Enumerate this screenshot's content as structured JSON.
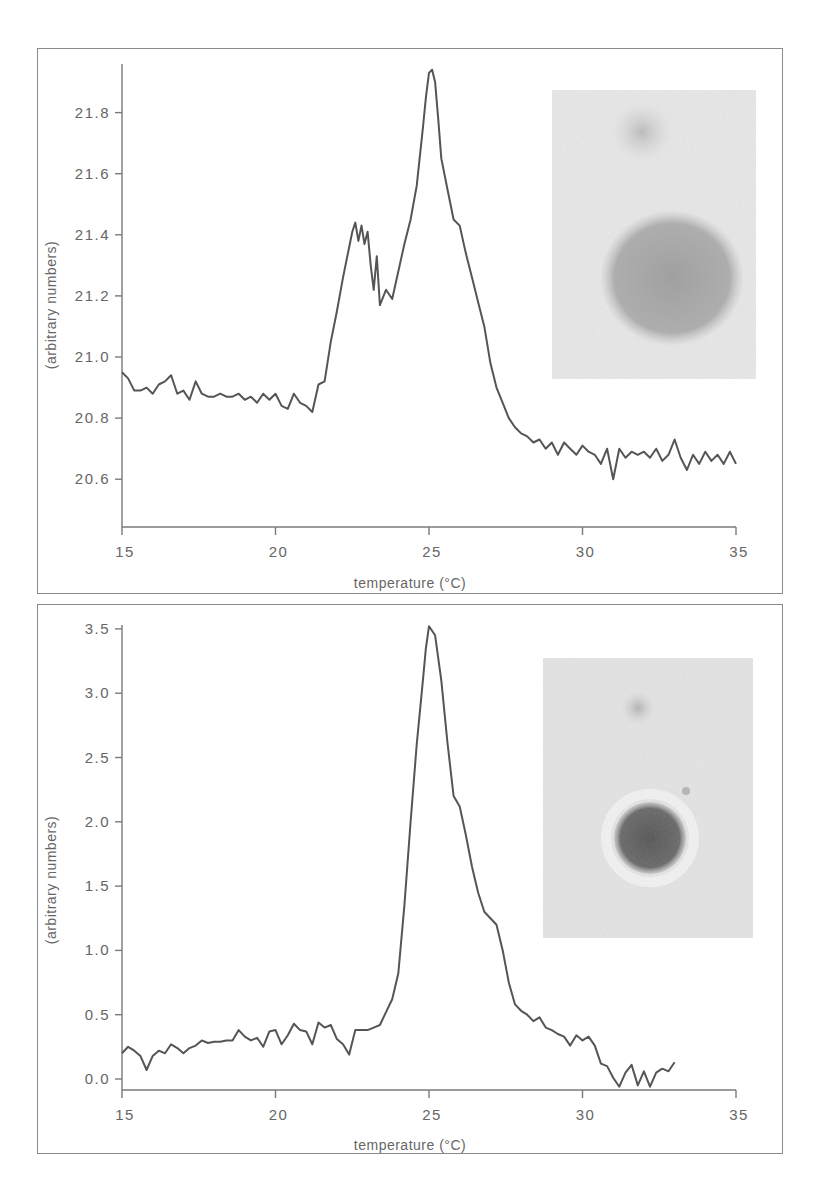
{
  "chart_data": [
    {
      "type": "line",
      "title": "",
      "xlabel": "temperature (°C)",
      "ylabel": "(arbitrary numbers)",
      "xlim": [
        15,
        35
      ],
      "ylim": [
        20.45,
        21.95
      ],
      "xticks": [
        15,
        20,
        25,
        30,
        35
      ],
      "xtick_labels": [
        "15",
        "20",
        "25",
        "30",
        "35"
      ],
      "yticks": [
        20.6,
        20.8,
        21.0,
        21.2,
        21.4,
        21.6,
        21.8
      ],
      "ytick_labels": [
        "20.6",
        "20.8",
        "21.0",
        "21.2",
        "21.4",
        "21.6",
        "21.8"
      ],
      "grid": false,
      "legend": null,
      "inset": "micrograph: faint small spot above a large diffuse grey circular domain",
      "series": [
        {
          "name": "signal",
          "x": [
            15.0,
            15.2,
            15.4,
            15.6,
            15.8,
            16.0,
            16.2,
            16.4,
            16.6,
            16.8,
            17.0,
            17.2,
            17.4,
            17.6,
            17.8,
            18.0,
            18.2,
            18.4,
            18.6,
            18.8,
            19.0,
            19.2,
            19.4,
            19.6,
            19.8,
            20.0,
            20.2,
            20.4,
            20.6,
            20.8,
            21.0,
            21.2,
            21.4,
            21.6,
            21.8,
            22.0,
            22.2,
            22.4,
            22.5,
            22.6,
            22.7,
            22.8,
            22.9,
            23.0,
            23.1,
            23.2,
            23.3,
            23.4,
            23.6,
            23.8,
            24.0,
            24.2,
            24.4,
            24.6,
            24.8,
            24.9,
            25.0,
            25.1,
            25.2,
            25.3,
            25.4,
            25.6,
            25.8,
            26.0,
            26.2,
            26.4,
            26.6,
            26.8,
            27.0,
            27.2,
            27.4,
            27.6,
            27.8,
            28.0,
            28.2,
            28.4,
            28.6,
            28.8,
            29.0,
            29.2,
            29.4,
            29.6,
            29.8,
            30.0,
            30.2,
            30.4,
            30.6,
            30.8,
            31.0,
            31.2,
            31.4,
            31.6,
            31.8,
            32.0,
            32.2,
            32.4,
            32.6,
            32.8,
            33.0,
            33.2,
            33.4,
            33.6,
            33.8,
            34.0,
            34.2,
            34.4,
            34.6,
            34.8,
            35.0
          ],
          "y": [
            20.95,
            20.93,
            20.89,
            20.89,
            20.9,
            20.88,
            20.91,
            20.92,
            20.94,
            20.88,
            20.89,
            20.86,
            20.92,
            20.88,
            20.87,
            20.87,
            20.88,
            20.87,
            20.87,
            20.88,
            20.86,
            20.87,
            20.85,
            20.88,
            20.86,
            20.88,
            20.84,
            20.83,
            20.88,
            20.85,
            20.84,
            20.82,
            20.91,
            20.92,
            21.05,
            21.15,
            21.26,
            21.36,
            21.41,
            21.44,
            21.38,
            21.43,
            21.37,
            21.41,
            21.3,
            21.22,
            21.33,
            21.17,
            21.22,
            21.19,
            21.28,
            21.37,
            21.45,
            21.56,
            21.75,
            21.85,
            21.93,
            21.94,
            21.9,
            21.78,
            21.65,
            21.55,
            21.45,
            21.43,
            21.34,
            21.26,
            21.18,
            21.1,
            20.98,
            20.9,
            20.85,
            20.8,
            20.77,
            20.75,
            20.74,
            20.72,
            20.73,
            20.7,
            20.72,
            20.68,
            20.72,
            20.7,
            20.68,
            20.71,
            20.69,
            20.68,
            20.65,
            20.7,
            20.6,
            20.7,
            20.67,
            20.69,
            20.68,
            20.69,
            20.67,
            20.7,
            20.66,
            20.68,
            20.73,
            20.67,
            20.63,
            20.68,
            20.65,
            20.69,
            20.66,
            20.68,
            20.65,
            20.69,
            20.65
          ]
        }
      ]
    },
    {
      "type": "line",
      "title": "",
      "xlabel": "temperature (°C)",
      "ylabel": "(arbitrary numbers)",
      "xlim": [
        15,
        35
      ],
      "ylim": [
        -0.08,
        3.6
      ],
      "xticks": [
        15,
        20,
        25,
        30,
        35
      ],
      "xtick_labels": [
        "15",
        "20",
        "25",
        "30",
        "35"
      ],
      "yticks": [
        0.0,
        0.5,
        1.0,
        1.5,
        2.0,
        2.5,
        3.0,
        3.5
      ],
      "ytick_labels": [
        "0.0",
        "0.5",
        "1.0",
        "1.5",
        "2.0",
        "2.5",
        "3.0",
        "3.5"
      ],
      "grid": false,
      "legend": null,
      "inset": "micrograph: faint small spot above a dark compact circular domain with a light halo",
      "series": [
        {
          "name": "signal",
          "x": [
            15.0,
            15.2,
            15.4,
            15.6,
            15.8,
            16.0,
            16.2,
            16.4,
            16.6,
            16.8,
            17.0,
            17.2,
            17.4,
            17.6,
            17.8,
            18.0,
            18.2,
            18.4,
            18.6,
            18.8,
            19.0,
            19.2,
            19.4,
            19.6,
            19.8,
            20.0,
            20.2,
            20.4,
            20.6,
            20.8,
            21.0,
            21.2,
            21.4,
            21.6,
            21.8,
            22.0,
            22.2,
            22.4,
            22.6,
            22.8,
            23.0,
            23.2,
            23.4,
            23.6,
            23.8,
            24.0,
            24.2,
            24.4,
            24.6,
            24.8,
            24.9,
            25.0,
            25.2,
            25.4,
            25.6,
            25.8,
            26.0,
            26.2,
            26.4,
            26.6,
            26.8,
            27.0,
            27.2,
            27.4,
            27.6,
            27.8,
            28.0,
            28.2,
            28.4,
            28.6,
            28.8,
            29.0,
            29.2,
            29.4,
            29.6,
            29.8,
            30.0,
            30.2,
            30.4,
            30.6,
            30.8,
            31.0,
            31.2,
            31.4,
            31.6,
            31.8,
            32.0,
            32.2,
            32.4,
            32.6,
            32.8,
            33.0
          ],
          "y": [
            0.2,
            0.25,
            0.22,
            0.18,
            0.07,
            0.18,
            0.22,
            0.2,
            0.27,
            0.24,
            0.2,
            0.24,
            0.26,
            0.3,
            0.28,
            0.29,
            0.29,
            0.3,
            0.3,
            0.38,
            0.33,
            0.3,
            0.32,
            0.25,
            0.37,
            0.38,
            0.27,
            0.34,
            0.43,
            0.38,
            0.37,
            0.27,
            0.44,
            0.4,
            0.42,
            0.31,
            0.27,
            0.19,
            0.38,
            0.38,
            0.38,
            0.4,
            0.42,
            0.52,
            0.62,
            0.82,
            1.35,
            2.0,
            2.6,
            3.1,
            3.35,
            3.52,
            3.45,
            3.1,
            2.62,
            2.2,
            2.12,
            1.9,
            1.65,
            1.45,
            1.3,
            1.25,
            1.2,
            1.0,
            0.75,
            0.58,
            0.53,
            0.5,
            0.45,
            0.48,
            0.4,
            0.38,
            0.35,
            0.33,
            0.26,
            0.34,
            0.3,
            0.33,
            0.26,
            0.12,
            0.1,
            0.01,
            -0.06,
            0.05,
            0.11,
            -0.05,
            0.06,
            -0.06,
            0.05,
            0.08,
            0.06,
            0.13
          ]
        }
      ]
    }
  ],
  "panels": {
    "top": {
      "xlabel": "temperature (°C)",
      "ylabel": "(arbitrary numbers)",
      "xtick_labels": [
        "15",
        "20",
        "25",
        "30",
        "35"
      ],
      "ytick_labels": [
        "21.8",
        "21.6",
        "21.4",
        "21.2",
        "21.0",
        "20.8",
        "20.6"
      ]
    },
    "bottom": {
      "xlabel": "temperature (°C)",
      "ylabel": "(arbitrary numbers)",
      "xtick_labels": [
        "15",
        "20",
        "25",
        "30",
        "35"
      ],
      "ytick_labels": [
        "3.5",
        "3.0",
        "2.5",
        "2.0",
        "1.5",
        "1.0",
        "0.5",
        "0.0"
      ]
    }
  },
  "colors": {
    "line": "#555555",
    "axis": "#7a7a7a",
    "text": "#666666",
    "frame": "#8a8a8a",
    "inset_background": "#e6e6e6",
    "inset_domain_top": "#9a9a9a",
    "inset_domain_bottom": "#5a5a5a"
  }
}
